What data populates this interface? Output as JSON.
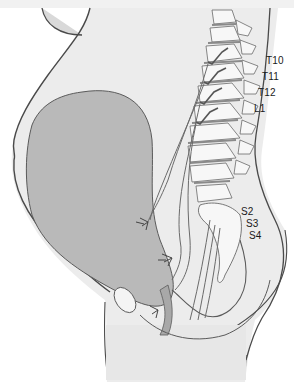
{
  "figure": {
    "labels": {
      "upper": [
        "T10",
        "T11",
        "T12",
        "L1"
      ],
      "lower": [
        "S2",
        "S3",
        "S4"
      ]
    },
    "colors": {
      "uterus": "#b9b9b9",
      "body": "#ededed",
      "bone": "#f6f6f6",
      "outline": "#555555",
      "nerve": "#6a6a6a",
      "text": "#1a1a1a"
    }
  }
}
